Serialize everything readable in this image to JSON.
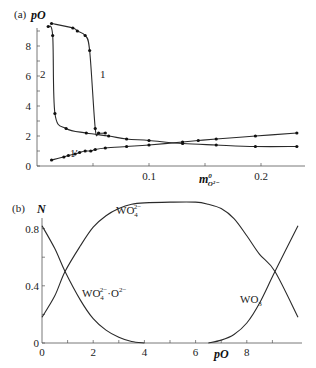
{
  "chart_data": [
    {
      "panel": "(a)",
      "type": "line",
      "ylabel": "pO",
      "xlabel": "m°O2-",
      "xlabel_main": "m",
      "xlabel_sup": "0",
      "xlabel_sub": "O²⁻",
      "xlim": [
        0,
        0.25
      ],
      "ylim": [
        0,
        9.5
      ],
      "x_ticks": [
        "0.1",
        "0.2"
      ],
      "x_tick_values": [
        0.1,
        0.2
      ],
      "y_ticks": [
        "0",
        "2",
        "4",
        "6",
        "8"
      ],
      "y_tick_values": [
        0,
        2,
        4,
        6,
        8
      ],
      "grid": false,
      "series": [
        {
          "name": "2",
          "x": [
            0.01,
            0.014,
            0.016,
            0.026,
            0.044,
            0.064,
            0.08,
            0.1,
            0.13,
            0.16,
            0.195,
            0.232
          ],
          "y": [
            9.3,
            8.7,
            3.5,
            2.5,
            2.2,
            2.0,
            1.8,
            1.7,
            1.5,
            1.4,
            1.3,
            1.3
          ]
        },
        {
          "name": "1",
          "x": [
            0.013,
            0.032,
            0.036,
            0.043,
            0.047,
            0.052,
            0.055,
            0.061
          ],
          "y": [
            9.5,
            9.2,
            9.0,
            8.7,
            7.7,
            2.5,
            2.2,
            2.2
          ]
        },
        {
          "name": "1'",
          "x": [
            0.013,
            0.024,
            0.028,
            0.034,
            0.038,
            0.043,
            0.048,
            0.052,
            0.061,
            0.08,
            0.1,
            0.13,
            0.144,
            0.16,
            0.195,
            0.232
          ],
          "y": [
            0.4,
            0.6,
            0.7,
            0.8,
            0.9,
            1.0,
            1.0,
            1.1,
            1.2,
            1.3,
            1.4,
            1.6,
            1.7,
            1.8,
            2.0,
            2.2
          ]
        }
      ],
      "curve_labels": [
        "2",
        "1",
        "1′"
      ]
    },
    {
      "panel": "(b)",
      "type": "line",
      "ylabel": "N",
      "xlabel": "pO",
      "xlim": [
        0,
        10
      ],
      "ylim": [
        0,
        1
      ],
      "x_ticks": [
        "0",
        "2",
        "4",
        "6",
        "8"
      ],
      "x_tick_values": [
        0,
        2,
        4,
        6,
        8
      ],
      "y_ticks": [
        "0",
        "0.4",
        "0.8"
      ],
      "y_tick_values": [
        0,
        0.4,
        0.8
      ],
      "grid": false,
      "series": [
        {
          "name": "WO4(2-)",
          "label_main": "WO",
          "label_sub": "4",
          "label_sup": "2−",
          "x": [
            0,
            0.5,
            0.9,
            1.5,
            2.0,
            2.5,
            3.0,
            3.5,
            4.0,
            5.0,
            6.0,
            6.5,
            7.0,
            7.5,
            8.0,
            8.5,
            9.1,
            10.0
          ],
          "y": [
            0.18,
            0.33,
            0.5,
            0.68,
            0.81,
            0.89,
            0.94,
            0.97,
            0.98,
            0.985,
            0.985,
            0.97,
            0.94,
            0.87,
            0.75,
            0.62,
            0.5,
            0.18
          ]
        },
        {
          "name": "WO4(2-)·O(2-)",
          "label_main": "WO",
          "label_sub": "4",
          "label_sup": "2−",
          "label_suffix": "·O",
          "label_suffix_sup": "2−",
          "x": [
            0,
            0.5,
            0.9,
            1.5,
            2.0,
            2.5,
            3.0,
            3.5,
            4.0
          ],
          "y": [
            0.82,
            0.66,
            0.5,
            0.3,
            0.17,
            0.09,
            0.04,
            0.01,
            0.0
          ]
        },
        {
          "name": "WO3",
          "label_main": "WO",
          "label_sub": "3",
          "x": [
            6.5,
            7.0,
            7.5,
            8.0,
            8.5,
            9.1,
            10.0
          ],
          "y": [
            0.0,
            0.02,
            0.06,
            0.14,
            0.28,
            0.5,
            0.82
          ]
        }
      ]
    }
  ],
  "labels": {
    "panel_a": "(a)",
    "panel_b": "(b)",
    "a_ylabel": "pO",
    "b_ylabel": "N",
    "b_xlabel": "pO",
    "a_xlabel_main": "m",
    "a_xlabel_sup": "0",
    "a_xlabel_sub": "O²⁻",
    "curve_2": "2",
    "curve_1": "1",
    "curve_1p": "1′",
    "wo4": "WO",
    "wo4_sub": "4",
    "wo4_sup": "2−",
    "wo4o_main": "WO",
    "wo4o_sub": "4",
    "wo4o_sup": "2−",
    "wo4o_suffix": "·O",
    "wo4o_suffix_sup": "2−",
    "wo3_main": "WO",
    "wo3_sub": "3"
  },
  "colors": {
    "line": "#2a2a2a",
    "axis": "#555555",
    "text": "#222222"
  }
}
